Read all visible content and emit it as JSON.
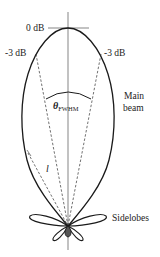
{
  "diagram": {
    "labels": {
      "zero_db": "0 dB",
      "minus3_left": "-3 dB",
      "minus3_right": "-3 dB",
      "theta": "θ",
      "theta_sub": "FWHM",
      "length": "l",
      "main_beam_line1": "Main",
      "main_beam_line2": "beam",
      "sidelobes": "Sidelobes"
    },
    "colors": {
      "stroke": "#1a1a1a",
      "text": "#222222",
      "background": "#ffffff"
    }
  }
}
